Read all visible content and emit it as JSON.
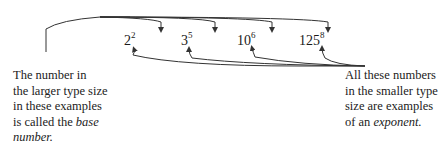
{
  "diagram": {
    "examples": [
      {
        "base": "2",
        "exponent": "2"
      },
      {
        "base": "3",
        "exponent": "5"
      },
      {
        "base": "10",
        "exponent": "6"
      },
      {
        "base": "125",
        "exponent": "8"
      }
    ],
    "left_caption": {
      "lines": [
        "The number in",
        "the larger type size",
        "in these examples",
        "is called the "
      ],
      "emphasis": "base",
      "emphasis_line2": "number."
    },
    "right_caption": {
      "lines": [
        "All these numbers",
        "in the smaller type",
        "size are examples",
        "of an "
      ],
      "emphasis": "exponent."
    },
    "colors": {
      "line": "#333333",
      "text": "#1a1a1a"
    }
  }
}
